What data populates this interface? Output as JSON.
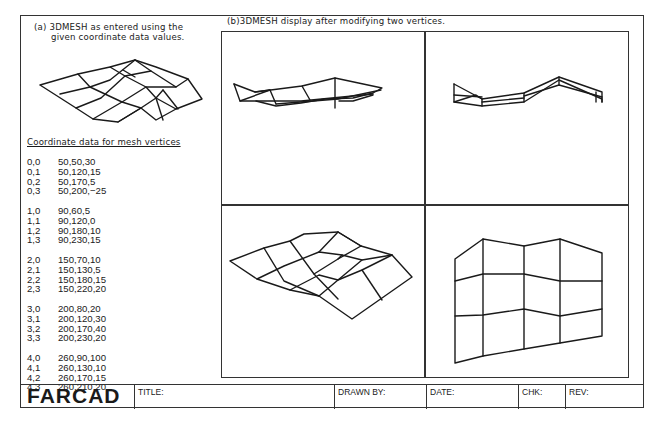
{
  "panel_a": {
    "caption_line1": "(a) 3DMESH as entered using the",
    "caption_line2": "given coordinate data values.",
    "coord_title": "Coordinate data for mesh vertices",
    "vertices": [
      [
        {
          "idx": "0,0",
          "val": "50,50,30"
        },
        {
          "idx": "0,1",
          "val": "50,120,15"
        },
        {
          "idx": "0,2",
          "val": "50,170,5"
        },
        {
          "idx": "0,3",
          "val": "50,200,−25"
        }
      ],
      [
        {
          "idx": "1,0",
          "val": "90,60,5"
        },
        {
          "idx": "1,1",
          "val": "90,120,0"
        },
        {
          "idx": "1,2",
          "val": "90,180,10"
        },
        {
          "idx": "1,3",
          "val": "90,230,15"
        }
      ],
      [
        {
          "idx": "2,0",
          "val": "150,70,10"
        },
        {
          "idx": "2,1",
          "val": "150,130,5"
        },
        {
          "idx": "2,2",
          "val": "150,180,15"
        },
        {
          "idx": "2,3",
          "val": "150,220,20"
        }
      ],
      [
        {
          "idx": "3,0",
          "val": "200,80,20"
        },
        {
          "idx": "3,1",
          "val": "200,120,30"
        },
        {
          "idx": "3,2",
          "val": "200,170,40"
        },
        {
          "idx": "3,3",
          "val": "200,230,20"
        }
      ],
      [
        {
          "idx": "4,0",
          "val": "260,90,100"
        },
        {
          "idx": "4,1",
          "val": "260,130,10"
        },
        {
          "idx": "4,2",
          "val": "260,170,15"
        },
        {
          "idx": "4,3",
          "val": "260,210,20"
        }
      ]
    ]
  },
  "panel_b": {
    "caption": "(b)3DMESH display after modifying two vertices.",
    "viewports": [
      "top-left-side-view",
      "top-right-front-view",
      "bottom-left-isometric-view",
      "bottom-right-plan-view"
    ]
  },
  "title_block": {
    "logo": "FARCAD",
    "title_label": "TITLE:",
    "drawn_by_label": "DRAWN  BY:",
    "date_label": "DATE:",
    "chk_label": "CHK:",
    "rev_label": "REV:"
  },
  "colors": {
    "line": "#1a1a1a",
    "background": "#ffffff"
  }
}
